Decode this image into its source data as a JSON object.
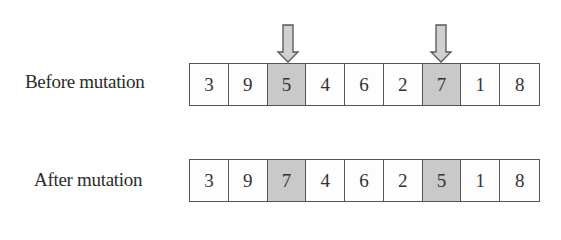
{
  "diagram": {
    "type": "swap-mutation",
    "rows": [
      {
        "label": "Before mutation",
        "cells": [
          "3",
          "9",
          "5",
          "4",
          "6",
          "2",
          "7",
          "1",
          "8"
        ],
        "highlighted": [
          2,
          6
        ],
        "arrows_above": [
          2,
          6
        ]
      },
      {
        "label": "After mutation",
        "cells": [
          "3",
          "9",
          "7",
          "4",
          "6",
          "2",
          "5",
          "1",
          "8"
        ],
        "highlighted": [
          2,
          6
        ]
      }
    ],
    "colors": {
      "highlight": "#c9c9c9",
      "cell": "#fdfdfd",
      "border": "#555555",
      "arrow_fill": "#d0d0d0",
      "arrow_stroke": "#555555"
    }
  }
}
